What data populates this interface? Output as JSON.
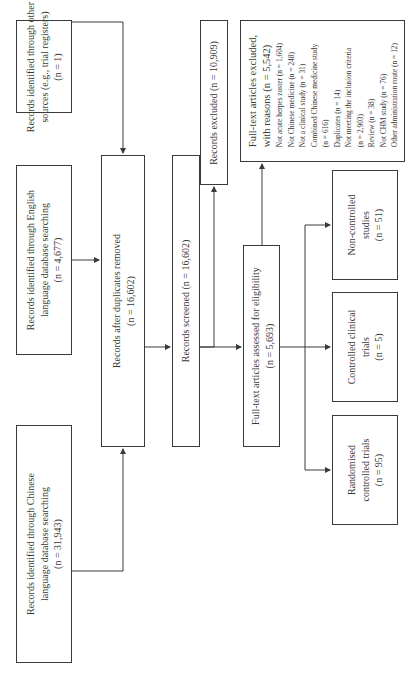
{
  "diagram": {
    "type": "PRISMA flow diagram",
    "orientation": "rotated 90 degrees counter-clockwise",
    "boxes": {
      "chinese_db": {
        "line1": "Records identified through Chinese",
        "line2": "language database searching",
        "count": "(n = 31,943)"
      },
      "english_db": {
        "line1": "Records identified through English",
        "line2": "language database searching",
        "count": "(n = 4,677)"
      },
      "other_sources": {
        "line1": "Records identified through other",
        "line2": "sources (e.g., trial registers)",
        "count": "(n = 1)"
      },
      "duplicates_removed": {
        "line1": "Records after duplicates removed",
        "count": "(n = 16,602)"
      },
      "screened": {
        "line1": "Records screened (n = 16,602)"
      },
      "excluded": {
        "line1": "Records excluded (n = 10,909)"
      },
      "fulltext_assessed": {
        "line1": "Full-text articles assessed for eligibility",
        "count": "(n = 5,693)"
      },
      "fulltext_excluded": {
        "line1": "Full-text articles excluded,",
        "line2": "with reasons (n = 5,542)",
        "reasons": [
          "Not acute herpes zoster (n = 1,604)",
          "Not Chinese medicine (n = 248)",
          "Not a clinical study (n = 31)",
          "Combined Chinese medicine study",
          "(n = 616)",
          "Duplicates (n = 14)",
          "Not meeting the inclusion criteria",
          "(n = 2,903)",
          "Review (n = 38)",
          "Not CHM study (n = 76)",
          "Other administration route (n = 12)"
        ]
      },
      "non_controlled": {
        "line1": "Non-controlled",
        "line2": "studies",
        "count": "(n = 51)"
      },
      "controlled_clinical": {
        "line1": "Controlled clinical",
        "line2": "trials",
        "count": "(n = 5)"
      },
      "rct": {
        "line1": "Randomised",
        "line2": "controlled trials",
        "count": "(n = 95)"
      }
    },
    "colors": {
      "stroke": "#3a3a3a",
      "background": "#ffffff"
    }
  }
}
